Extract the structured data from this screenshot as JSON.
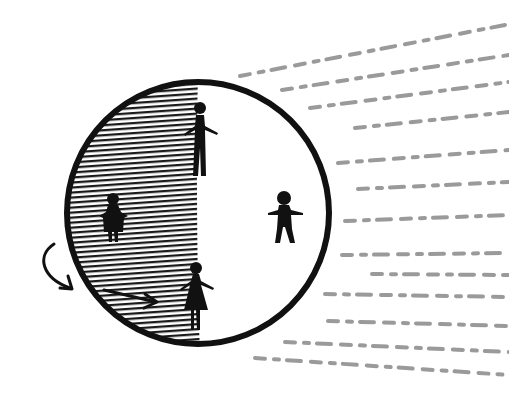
{
  "illustration": {
    "subject": "Earth day and night",
    "colors": {
      "background": "#ffffff",
      "ink": "#111111",
      "rays": "#9a9a9a",
      "hatch": "#1a1a1a"
    },
    "planet": {
      "cx": 198,
      "cy": 213,
      "r": 132,
      "terminator_x": 198
    },
    "figures": [
      {
        "name": "person-at-terminator-top",
        "type": "man",
        "side": "terminator",
        "x": 200,
        "y": 100
      },
      {
        "name": "person-on-night-side",
        "type": "child",
        "side": "night",
        "x": 113,
        "y": 195
      },
      {
        "name": "person-on-day-side",
        "type": "man",
        "side": "day",
        "x": 284,
        "y": 190
      },
      {
        "name": "person-at-terminator-bottom",
        "type": "woman",
        "side": "terminator",
        "x": 196,
        "y": 262
      }
    ],
    "arrows": [
      {
        "name": "rotation-arrow",
        "description": "curved arrow indicating rotation"
      },
      {
        "name": "motion-arrow",
        "description": "straight arrow on night side pointing toward terminator"
      }
    ],
    "rays": {
      "direction": "from right",
      "count": 14
    }
  }
}
